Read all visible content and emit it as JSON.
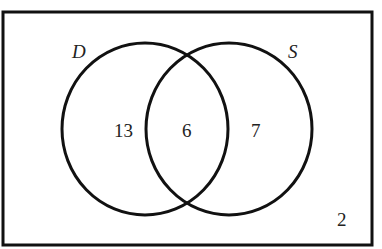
{
  "diagram": {
    "type": "venn",
    "sets": [
      {
        "name": "D",
        "only_count": "13"
      },
      {
        "name": "S",
        "only_count": "7"
      }
    ],
    "intersection_count": "6",
    "outside_count": "2",
    "colors": {
      "stroke": "#111111",
      "background": "#ffffff",
      "text": "#222222"
    }
  }
}
